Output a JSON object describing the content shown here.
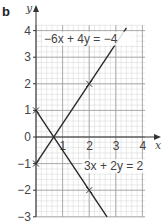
{
  "part_label": "b",
  "chart_data": {
    "type": "line",
    "title": "",
    "xlabel": "x",
    "ylabel": "y",
    "xlim": [
      0,
      4.1
    ],
    "ylim": [
      -3,
      4.2
    ],
    "grid": true,
    "grid_minor_step": 0.2,
    "x_ticks": [
      "1",
      "2",
      "3",
      "4"
    ],
    "y_ticks": [
      "4",
      "3",
      "2",
      "1",
      "0",
      "−1",
      "−2",
      "−3"
    ],
    "series": [
      {
        "name": "−6x + 4y = −4",
        "equation": "y = 1.5x - 1",
        "points_marked": [
          [
            0,
            -1
          ],
          [
            2,
            2
          ]
        ],
        "x_range": [
          0,
          3.4
        ]
      },
      {
        "name": "3x + 2y = 2",
        "equation": "y = 1 - 1.5x",
        "points_marked": [
          [
            0,
            1
          ],
          [
            2,
            -2
          ]
        ],
        "x_range": [
          0,
          2.67
        ]
      }
    ],
    "annotations": [
      {
        "text": "−6x + 4y = −4",
        "near": [
          0.3,
          3.7
        ]
      },
      {
        "text": "3x + 2y = 2",
        "near": [
          1.8,
          -1.1
        ]
      }
    ],
    "intersection": [
      0.667,
      0
    ]
  }
}
